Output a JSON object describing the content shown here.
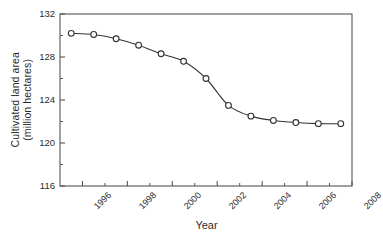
{
  "chart_data": {
    "type": "line",
    "title": "",
    "xlabel": "Year",
    "ylabel": "Cultivated land area (million hectares)",
    "ylabel_line1": "Cultivated land area",
    "ylabel_line2": "(million hectares)",
    "xlim": [
      1995,
      2008
    ],
    "ylim": [
      116,
      132
    ],
    "grid": false,
    "legend": null,
    "marker": "open-circle",
    "line_color": "#333333",
    "marker_face_color": "#ffffff",
    "marker_edge_color": "#333333",
    "axis_color": "#555555",
    "x_major_ticks": [
      1996,
      1998,
      2000,
      2002,
      2004,
      2006,
      2008
    ],
    "x_major_tick_labels": [
      "1996",
      "1998",
      "2000",
      "2002",
      "2004",
      "2006",
      "2008"
    ],
    "x_minor_ticks": [
      1997,
      1999,
      2001,
      2003,
      2005,
      2007
    ],
    "y_major_ticks": [
      116,
      120,
      124,
      128,
      132
    ],
    "y_major_tick_labels": [
      "116",
      "120",
      "124",
      "128",
      "132"
    ],
    "y_minor_ticks": [
      118,
      122,
      126,
      130
    ],
    "x": [
      1995.5,
      1996.5,
      1997.5,
      1998.5,
      1999.5,
      2000.5,
      2001.5,
      2002.5,
      2003.5,
      2004.5,
      2005.5,
      2006.5,
      2007.5
    ],
    "values": [
      130.2,
      130.1,
      129.7,
      129.1,
      128.3,
      127.6,
      126.0,
      123.5,
      122.5,
      122.1,
      121.9,
      121.8,
      121.8
    ],
    "points": [
      {
        "x": 1995.5,
        "y": 130.2
      },
      {
        "x": 1996.5,
        "y": 130.1
      },
      {
        "x": 1997.5,
        "y": 129.7
      },
      {
        "x": 1998.5,
        "y": 129.1
      },
      {
        "x": 1999.5,
        "y": 128.3
      },
      {
        "x": 2000.5,
        "y": 127.6
      },
      {
        "x": 2001.5,
        "y": 126.0
      },
      {
        "x": 2002.5,
        "y": 123.5
      },
      {
        "x": 2003.5,
        "y": 122.5
      },
      {
        "x": 2004.5,
        "y": 122.1
      },
      {
        "x": 2005.5,
        "y": 121.9
      },
      {
        "x": 2006.5,
        "y": 121.8
      },
      {
        "x": 2007.5,
        "y": 121.8
      }
    ]
  }
}
